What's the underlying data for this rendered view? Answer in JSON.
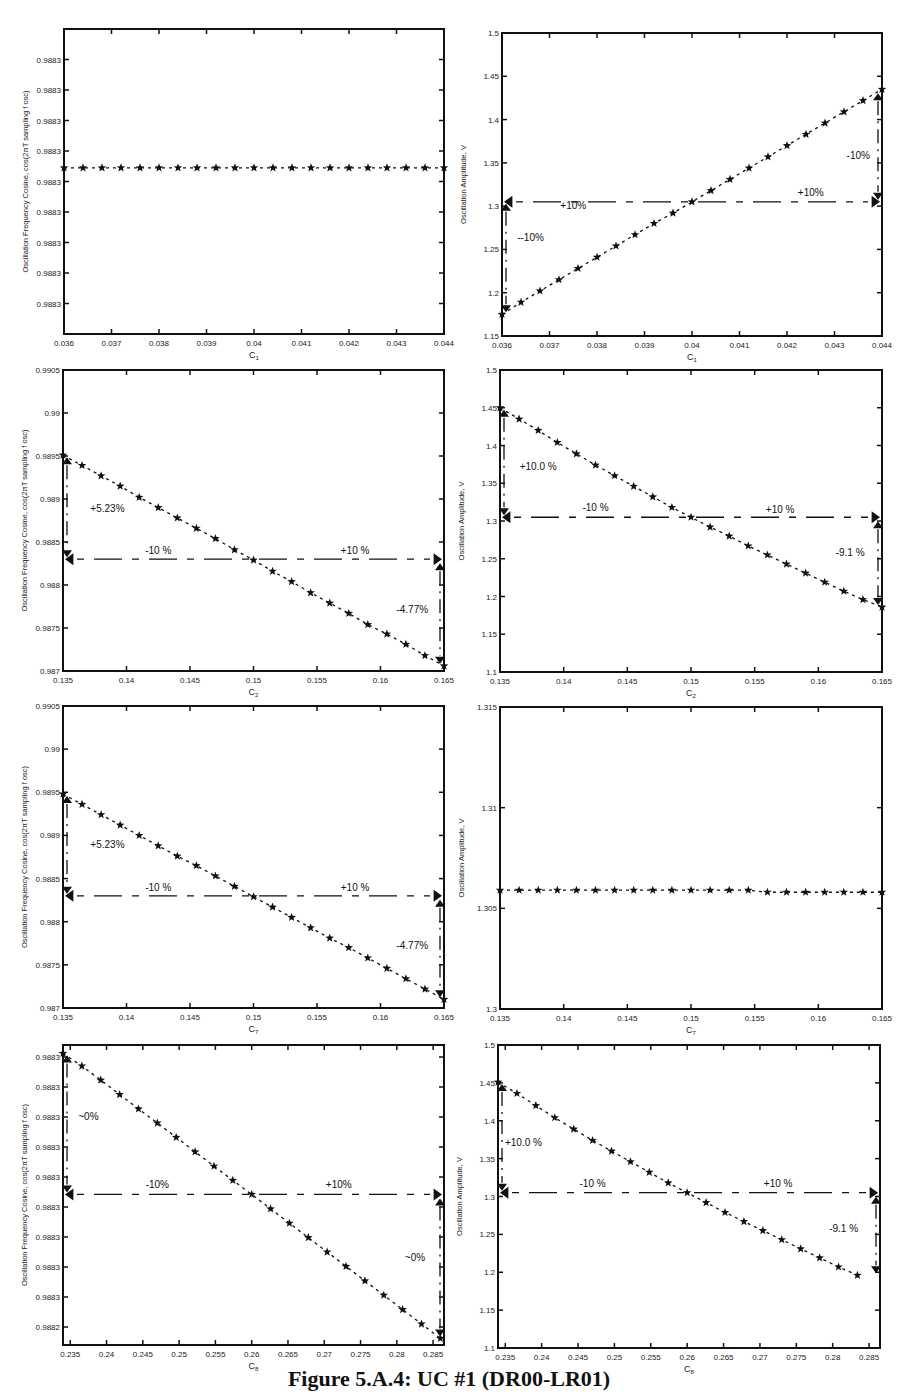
{
  "figure": {
    "caption": "Figure 5.A.4: UC #1 (DR00-LR01)"
  },
  "chart_data": [
    {
      "id": "p1",
      "type": "line",
      "title": "",
      "xlabel": "C1",
      "ylabel": "Oscillation Frequency Cosine, cos(2πT sampling f osc)",
      "xlim": [
        0.036,
        0.044
      ],
      "ylim": [
        0,
        10
      ],
      "xticks": [
        "0.036",
        "0.037",
        "0.038",
        "0.039",
        "0.04",
        "0.041",
        "0.042",
        "0.043",
        "0.044"
      ],
      "yticks": [
        "0.9883",
        "0.9883",
        "0.9883",
        "0.9883",
        "0.9883",
        "0.9883",
        "0.9883",
        "0.9883",
        "0.9883"
      ],
      "ytick_positions": [
        1,
        2,
        3,
        4,
        5,
        6,
        7,
        8,
        9
      ],
      "x": [
        0.036,
        0.0364,
        0.0368,
        0.0372,
        0.0376,
        0.038,
        0.0384,
        0.0388,
        0.0392,
        0.0396,
        0.04,
        0.0404,
        0.0408,
        0.0412,
        0.0416,
        0.042,
        0.0424,
        0.0428,
        0.0432,
        0.0436,
        0.044
      ],
      "values": [
        5.45,
        5.45,
        5.45,
        5.45,
        5.45,
        5.45,
        5.45,
        5.45,
        5.45,
        5.45,
        5.45,
        5.45,
        5.45,
        5.45,
        5.45,
        5.45,
        5.45,
        5.45,
        5.45,
        5.45,
        5.45
      ],
      "annotations": []
    },
    {
      "id": "p2",
      "type": "line",
      "title": "",
      "xlabel": "C1",
      "ylabel": "Oscillation Amplitude, V",
      "xlim": [
        0.036,
        0.044
      ],
      "ylim": [
        1.15,
        1.5
      ],
      "xticks": [
        "0.036",
        "0.037",
        "0.038",
        "0.039",
        "0.04",
        "0.041",
        "0.042",
        "0.043",
        "0.044"
      ],
      "yticks": [
        "1.15",
        "1.2",
        "1.25",
        "1.3",
        "1.35",
        "1.4",
        "1.45",
        "1.5"
      ],
      "x": [
        0.036,
        0.0364,
        0.0368,
        0.0372,
        0.0376,
        0.038,
        0.0384,
        0.0388,
        0.0392,
        0.0396,
        0.04,
        0.0404,
        0.0408,
        0.0412,
        0.0416,
        0.042,
        0.0424,
        0.0428,
        0.0432,
        0.0436,
        0.044
      ],
      "values": [
        1.175,
        1.189,
        1.202,
        1.215,
        1.228,
        1.241,
        1.254,
        1.267,
        1.28,
        1.292,
        1.305,
        1.318,
        1.331,
        1.344,
        1.357,
        1.37,
        1.383,
        1.396,
        1.409,
        1.422,
        1.435
      ],
      "annotations": [
        {
          "text": "+10%",
          "x": 0.0375,
          "y": 1.297
        },
        {
          "text": "+10%",
          "x": 0.0425,
          "y": 1.312
        },
        {
          "text": "--10%",
          "x": 0.0366,
          "y": 1.26
        },
        {
          "text": "-10%",
          "x": 0.0435,
          "y": 1.355
        }
      ],
      "ref_line_y": 1.305
    },
    {
      "id": "p3",
      "type": "line",
      "title": "",
      "xlabel": "C2",
      "ylabel": "Oscillation Frequency Cosine, cos(2πT sampling f osc)",
      "xlim": [
        0.135,
        0.165
      ],
      "ylim": [
        0.987,
        0.9905
      ],
      "xticks": [
        "0.135",
        "0.14",
        "0.145",
        "0.15",
        "0.155",
        "0.16",
        "0.165"
      ],
      "yticks": [
        "0.987",
        "0.9875",
        "0.988",
        "0.9885",
        "0.989",
        "0.9895",
        "0.99",
        "0.9905"
      ],
      "x": [
        0.135,
        0.1365,
        0.138,
        0.1395,
        0.141,
        0.1425,
        0.144,
        0.1455,
        0.147,
        0.1485,
        0.15,
        0.1515,
        0.153,
        0.1545,
        0.156,
        0.1575,
        0.159,
        0.1605,
        0.162,
        0.1635,
        0.165
      ],
      "values": [
        0.98951,
        0.98939,
        0.98927,
        0.98915,
        0.98902,
        0.9889,
        0.98878,
        0.98866,
        0.98854,
        0.98841,
        0.98829,
        0.98816,
        0.98804,
        0.98791,
        0.98779,
        0.98767,
        0.98754,
        0.98743,
        0.98731,
        0.98718,
        0.98706
      ],
      "annotations": [
        {
          "text": "+5.23%",
          "x": 0.1385,
          "y": 0.98885
        },
        {
          "text": "-10 %",
          "x": 0.1425,
          "y": 0.98836
        },
        {
          "text": "+10 %",
          "x": 0.158,
          "y": 0.98836
        },
        {
          "text": "-4.77%",
          "x": 0.1625,
          "y": 0.98768
        }
      ],
      "ref_line_y": 0.9883
    },
    {
      "id": "p4",
      "type": "line",
      "title": "",
      "xlabel": "C2",
      "ylabel": "Oscillation Amplitude, V",
      "xlim": [
        0.135,
        0.165
      ],
      "ylim": [
        1.1,
        1.5
      ],
      "xticks": [
        "0.135",
        "0.14",
        "0.145",
        "0.15",
        "0.155",
        "0.16",
        "0.165"
      ],
      "yticks": [
        "1.1",
        "1.15",
        "1.2",
        "1.25",
        "1.3",
        "1.35",
        "1.4",
        "1.45",
        "1.5"
      ],
      "x": [
        0.135,
        0.1365,
        0.138,
        0.1395,
        0.141,
        0.1425,
        0.144,
        0.1455,
        0.147,
        0.1485,
        0.15,
        0.1515,
        0.153,
        0.1545,
        0.156,
        0.1575,
        0.159,
        0.1605,
        0.162,
        0.1635,
        0.165
      ],
      "values": [
        1.45,
        1.435,
        1.42,
        1.404,
        1.389,
        1.374,
        1.36,
        1.346,
        1.332,
        1.318,
        1.305,
        1.292,
        1.28,
        1.267,
        1.255,
        1.243,
        1.231,
        1.219,
        1.207,
        1.196,
        1.186
      ],
      "annotations": [
        {
          "text": "+10.0 %",
          "x": 0.138,
          "y": 1.367
        },
        {
          "text": "-10 %",
          "x": 0.1425,
          "y": 1.313
        },
        {
          "text": "+10 %",
          "x": 0.157,
          "y": 1.311
        },
        {
          "text": "-9.1 %",
          "x": 0.1625,
          "y": 1.253
        }
      ],
      "ref_line_y": 1.305
    },
    {
      "id": "p5",
      "type": "line",
      "title": "",
      "xlabel": "C7",
      "ylabel": "Oscillation Frequency Cosine, cos(2πT sampling f osc)",
      "xlim": [
        0.135,
        0.165
      ],
      "ylim": [
        0.987,
        0.9905
      ],
      "xticks": [
        "0.135",
        "0.14",
        "0.145",
        "0.15",
        "0.155",
        "0.16",
        "0.165"
      ],
      "yticks": [
        "0.987",
        "0.9875",
        "0.988",
        "0.9885",
        "0.989",
        "0.9895",
        "0.99",
        "0.9905"
      ],
      "x": [
        0.135,
        0.1365,
        0.138,
        0.1395,
        0.141,
        0.1425,
        0.144,
        0.1455,
        0.147,
        0.1485,
        0.15,
        0.1515,
        0.153,
        0.1545,
        0.156,
        0.1575,
        0.159,
        0.1605,
        0.162,
        0.1635,
        0.165
      ],
      "values": [
        0.98948,
        0.98936,
        0.98924,
        0.98912,
        0.989,
        0.98888,
        0.98876,
        0.98865,
        0.98853,
        0.98841,
        0.98829,
        0.98817,
        0.98805,
        0.98793,
        0.98781,
        0.9877,
        0.98758,
        0.98746,
        0.98734,
        0.98722,
        0.9871
      ],
      "annotations": [
        {
          "text": "+5.23%",
          "x": 0.1385,
          "y": 0.98885
        },
        {
          "text": "-10 %",
          "x": 0.1425,
          "y": 0.98836
        },
        {
          "text": "+10 %",
          "x": 0.158,
          "y": 0.98836
        },
        {
          "text": "-4.77%",
          "x": 0.1625,
          "y": 0.98768
        }
      ],
      "ref_line_y": 0.9883
    },
    {
      "id": "p6",
      "type": "line",
      "title": "",
      "xlabel": "C7",
      "ylabel": "Oscillation Amplitude, V",
      "xlim": [
        0.135,
        0.165
      ],
      "ylim": [
        1.3,
        1.315
      ],
      "xticks": [
        "0.135",
        "0.14",
        "0.145",
        "0.15",
        "0.155",
        "0.16",
        "0.165"
      ],
      "yticks": [
        "1.3",
        "1.305",
        "1.31",
        "1.315"
      ],
      "x": [
        0.135,
        0.1365,
        0.138,
        0.1395,
        0.141,
        0.1425,
        0.144,
        0.1455,
        0.147,
        0.1485,
        0.15,
        0.1515,
        0.153,
        0.1545,
        0.156,
        0.1575,
        0.159,
        0.1605,
        0.162,
        0.1635,
        0.165
      ],
      "values": [
        1.3059,
        1.3059,
        1.3059,
        1.3059,
        1.3059,
        1.3059,
        1.3059,
        1.3059,
        1.3059,
        1.3059,
        1.3059,
        1.3059,
        1.3059,
        1.3059,
        1.3058,
        1.3058,
        1.3058,
        1.3058,
        1.3058,
        1.3058,
        1.3058
      ],
      "annotations": []
    },
    {
      "id": "p7",
      "type": "line",
      "title": "",
      "xlabel": "C8",
      "ylabel": "Oscillation Frequency Cosine, cos(2πT sampling f osc)",
      "xlim": [
        0.234,
        0.2865
      ],
      "ylim": [
        0,
        10
      ],
      "xticks": [
        "0.235",
        "0.24",
        "0.245",
        "0.25",
        "0.255",
        "0.26",
        "0.265",
        "0.27",
        "0.275",
        "0.28",
        "0.285"
      ],
      "yticks": [
        "0.9882",
        "0.9883",
        "0.9883",
        "0.9883",
        "0.9883",
        "0.9883",
        "0.9883",
        "0.9883",
        "0.9883",
        "0.9883"
      ],
      "ytick_positions": [
        0.6,
        1.6,
        2.6,
        3.6,
        4.6,
        5.6,
        6.6,
        7.6,
        8.6,
        9.6
      ],
      "x": [
        0.234,
        0.2366,
        0.2392,
        0.2418,
        0.2444,
        0.247,
        0.2496,
        0.2522,
        0.2548,
        0.2574,
        0.26,
        0.2626,
        0.2652,
        0.2678,
        0.2704,
        0.273,
        0.2756,
        0.2782,
        0.2808,
        0.2834,
        0.286
      ],
      "values": [
        9.72,
        9.3,
        8.83,
        8.35,
        7.87,
        7.4,
        6.92,
        6.44,
        5.96,
        5.49,
        5.02,
        4.54,
        4.06,
        3.58,
        3.1,
        2.62,
        2.14,
        1.66,
        1.18,
        0.7,
        0.22
      ],
      "annotations": [
        {
          "text": "~0%",
          "x": 0.2375,
          "y": 7.5
        },
        {
          "text": "-10%",
          "x": 0.247,
          "y": 5.25
        },
        {
          "text": "+10%",
          "x": 0.272,
          "y": 5.25
        },
        {
          "text": "~0%",
          "x": 0.2825,
          "y": 2.8
        }
      ],
      "ref_line_y": 5.02
    },
    {
      "id": "p8",
      "type": "line",
      "title": "",
      "xlabel": "C8",
      "ylabel": "Oscillation Amplitude, V",
      "xlim": [
        0.234,
        0.2865
      ],
      "ylim": [
        1.1,
        1.5
      ],
      "xticks": [
        "0.235",
        "0.24",
        "0.245",
        "0.25",
        "0.255",
        "0.26",
        "0.265",
        "0.27",
        "0.275",
        "0.28",
        "0.285"
      ],
      "yticks": [
        "1.1",
        "1.15",
        "1.2",
        "1.25",
        "1.3",
        "1.35",
        "1.4",
        "1.45",
        "1.5"
      ],
      "x": [
        0.234,
        0.2366,
        0.2392,
        0.2418,
        0.2444,
        0.247,
        0.2496,
        0.2522,
        0.2548,
        0.2574,
        0.26,
        0.2626,
        0.2652,
        0.2678,
        0.2704,
        0.273,
        0.2756,
        0.2782,
        0.2808,
        0.2834
      ],
      "values": [
        1.451,
        1.436,
        1.42,
        1.404,
        1.389,
        1.374,
        1.36,
        1.346,
        1.332,
        1.318,
        1.305,
        1.292,
        1.279,
        1.267,
        1.255,
        1.243,
        1.231,
        1.219,
        1.207,
        1.196
      ],
      "annotations": [
        {
          "text": "+10.0 %",
          "x": 0.2375,
          "y": 1.367
        },
        {
          "text": "-10 %",
          "x": 0.247,
          "y": 1.313
        },
        {
          "text": "+10 %",
          "x": 0.2725,
          "y": 1.313
        },
        {
          "text": "-9.1 %",
          "x": 0.2815,
          "y": 1.253
        }
      ],
      "ref_line_y": 1.305
    }
  ]
}
